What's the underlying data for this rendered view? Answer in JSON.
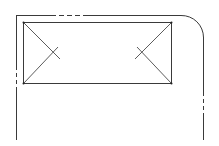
{
  "diagram": {
    "type": "technical-drawing",
    "outline": {
      "corner": "top-right-rounded",
      "line_style": "solid-with-dash-breaks"
    },
    "inner_panel": {
      "markings": [
        "left-x-cross",
        "right-x-cross"
      ]
    },
    "colors": {
      "line": "#3a3a3a",
      "background": "#ffffff"
    }
  }
}
